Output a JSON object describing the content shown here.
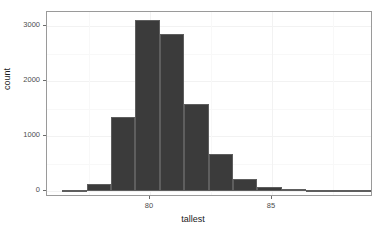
{
  "chart_data": {
    "type": "bar",
    "title": "",
    "xlabel": "tallest",
    "ylabel": "count",
    "xlim": [
      76.4,
      89.8
    ],
    "ylim": [
      0,
      3250
    ],
    "bin_width": 1,
    "grid": true,
    "legend": null,
    "xticks": [
      80,
      85
    ],
    "xtick_labels": [
      "80",
      "85"
    ],
    "yticks": [
      0,
      1000,
      2000,
      3000
    ],
    "ytick_labels": [
      "0",
      "1000",
      "2000",
      "3000"
    ],
    "bar_color": "#3b3b3b",
    "bar_border_color": "#5e5e5e",
    "panel_background": "#ffffff",
    "grid_color": "#f2f2f2",
    "bins": [
      {
        "x0": 76.4,
        "x1": 77.4,
        "count": 5
      },
      {
        "x0": 77.4,
        "x1": 78.4,
        "count": 125
      },
      {
        "x0": 78.4,
        "x1": 79.4,
        "count": 1340
      },
      {
        "x0": 79.4,
        "x1": 80.4,
        "count": 3110
      },
      {
        "x0": 80.4,
        "x1": 81.4,
        "count": 2850
      },
      {
        "x0": 81.4,
        "x1": 82.4,
        "count": 1590
      },
      {
        "x0": 82.4,
        "x1": 83.4,
        "count": 680
      },
      {
        "x0": 83.4,
        "x1": 84.4,
        "count": 215
      },
      {
        "x0": 84.4,
        "x1": 85.4,
        "count": 70
      },
      {
        "x0": 85.4,
        "x1": 86.4,
        "count": 30
      },
      {
        "x0": 86.4,
        "x1": 89.8,
        "count": 4
      }
    ],
    "categories": [
      "76.9",
      "77.9",
      "78.9",
      "79.9",
      "80.9",
      "81.9",
      "82.9",
      "83.9",
      "84.9",
      "85.9",
      "88.1"
    ],
    "values": [
      5,
      125,
      1340,
      3110,
      2850,
      1590,
      680,
      215,
      70,
      30,
      4
    ]
  }
}
